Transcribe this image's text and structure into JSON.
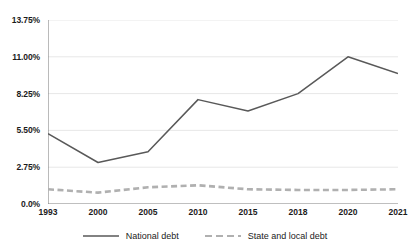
{
  "chart_data": {
    "type": "line",
    "title": "",
    "subtitle": "",
    "xlabel": "",
    "ylabel": "",
    "grid": true,
    "legend_position": "bottom",
    "x": [
      "1993",
      "2000",
      "2005",
      "2010",
      "2015",
      "2018",
      "2020",
      "2021"
    ],
    "categories": [
      "1993",
      "2000",
      "2005",
      "2010",
      "2015",
      "2018",
      "2020",
      "2021"
    ],
    "y_ticks": [
      "0.0%",
      "2.75%",
      "5.50%",
      "8.25%",
      "11.00%",
      "13.75%"
    ],
    "y_tick_values": [
      0,
      2.75,
      5.5,
      8.25,
      11,
      13.75
    ],
    "ylim": [
      0,
      13.75
    ],
    "series": [
      {
        "name": "National debt",
        "style": "solid",
        "color": "#595959",
        "values": [
          5.25,
          3.1,
          3.9,
          7.8,
          6.95,
          8.25,
          11.0,
          9.75
        ]
      },
      {
        "name": "State and local debt",
        "style": "dashed",
        "color": "#b0b0b0",
        "values": [
          1.1,
          0.85,
          1.25,
          1.4,
          1.1,
          1.05,
          1.05,
          1.1
        ]
      }
    ]
  },
  "legend": {
    "items": [
      {
        "label": "National debt"
      },
      {
        "label": "State and local debt"
      }
    ]
  }
}
